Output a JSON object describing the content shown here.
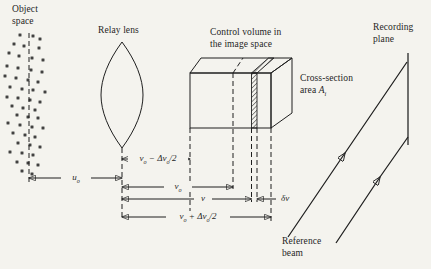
{
  "colors": {
    "paper": "#f4f3ee",
    "ink": "#1f1f1f"
  },
  "captions": {
    "object_space_line1": "Object",
    "object_space_line2": "space",
    "relay_lens": "Relay lens",
    "control_volume_line1": "Control volume in",
    "control_volume_line2": "the image space",
    "cross_section_line1": "Cross-section",
    "cross_section_word": "area",
    "cross_section_symbol": "A_i",
    "recording_plane_line1": "Recording",
    "recording_plane_line2": "plane",
    "reference_beam_line1": "Reference",
    "reference_beam_line2": "beam"
  },
  "dimensions": {
    "object_distance": "u_o",
    "inner_bound": "v_o − Δv_o/2",
    "image_distance": "v_o",
    "slab_distance": "v",
    "slab_thickness": "δv",
    "outer_bound": "v_o + Δv_o/2"
  },
  "particles": [
    [
      20,
      35
    ],
    [
      33,
      36
    ],
    [
      40,
      39
    ],
    [
      14,
      44
    ],
    [
      24,
      46
    ],
    [
      39,
      48
    ],
    [
      9,
      53
    ],
    [
      19,
      56
    ],
    [
      32,
      58
    ],
    [
      43,
      60
    ],
    [
      7,
      66
    ],
    [
      18,
      68
    ],
    [
      31,
      70
    ],
    [
      42,
      72
    ],
    [
      5,
      76
    ],
    [
      16,
      78
    ],
    [
      28,
      80
    ],
    [
      38,
      82
    ],
    [
      10,
      87
    ],
    [
      22,
      89
    ],
    [
      33,
      90
    ],
    [
      45,
      92
    ],
    [
      7,
      97
    ],
    [
      18,
      98
    ],
    [
      30,
      100
    ],
    [
      40,
      102
    ],
    [
      12,
      106
    ],
    [
      23,
      108
    ],
    [
      35,
      110
    ],
    [
      17,
      115
    ],
    [
      28,
      117
    ],
    [
      38,
      118
    ],
    [
      8,
      123
    ],
    [
      20,
      125
    ],
    [
      32,
      127
    ],
    [
      43,
      128
    ],
    [
      13,
      133
    ],
    [
      25,
      135
    ],
    [
      35,
      137
    ],
    [
      18,
      143
    ],
    [
      30,
      145
    ],
    [
      40,
      147
    ],
    [
      10,
      152
    ],
    [
      22,
      153
    ],
    [
      33,
      155
    ],
    [
      17,
      162
    ],
    [
      28,
      163
    ],
    [
      38,
      165
    ],
    [
      22,
      171
    ],
    [
      32,
      174
    ]
  ]
}
